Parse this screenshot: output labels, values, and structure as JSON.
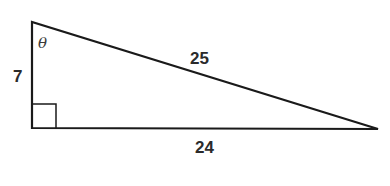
{
  "diagram": {
    "type": "right-triangle",
    "labels": {
      "angle": "θ",
      "vertical_leg": "7",
      "hypotenuse": "25",
      "horizontal_leg": "24"
    },
    "right_angle_marker": true,
    "colors": {
      "stroke": "#1a1a1a",
      "text": "#2b2b2b",
      "background": "#ffffff"
    }
  }
}
